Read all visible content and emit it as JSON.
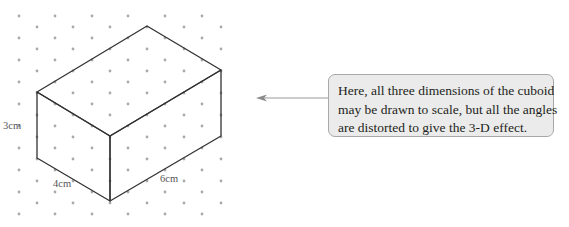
{
  "figure": {
    "colors": {
      "edge": "#333333",
      "dot": "#a9a9a9",
      "arrow": "#9a9a9a",
      "callout_bg": "#ebebeb",
      "callout_border": "#a8a8a8",
      "label": "#555555"
    },
    "dimensions": {
      "height": "3cm",
      "width": "4cm",
      "length": "6cm"
    },
    "callout": {
      "lines": [
        "Here, all three dimensions of the cuboid",
        "may be drawn to scale, but all the angles",
        "are distorted to give the 3-D effect."
      ]
    }
  }
}
